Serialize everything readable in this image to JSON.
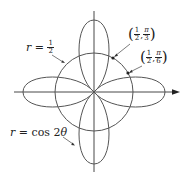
{
  "diagram": {
    "type": "polar-graph",
    "colors": {
      "curve": "#555555",
      "axis": "#333333",
      "point": "#222222",
      "text": "#222222",
      "background": "#ffffff"
    },
    "axes": {
      "horizontal": "polar axis with arrow",
      "vertical": "line"
    },
    "curves": [
      {
        "id": "circle",
        "equation": "r = 1/2"
      },
      {
        "id": "rose",
        "equation": "r = cos 2θ",
        "petals": 4
      }
    ],
    "labels": {
      "circle": {
        "lhs": "r",
        "eq": "=",
        "num": "1",
        "den": "2"
      },
      "rose": {
        "lhs": "r",
        "eq": "=",
        "rhs": "cos 2",
        "theta": "θ"
      },
      "point1": {
        "r_num": "1",
        "r_den": "2",
        "sep": ",",
        "t_num": "π",
        "t_den": "3"
      },
      "point2": {
        "r_num": "1",
        "r_den": "2",
        "sep": ",",
        "t_num": "π",
        "t_den": "6"
      }
    },
    "points": [
      {
        "r": "1/2",
        "theta": "π/3"
      },
      {
        "r": "1/2",
        "theta": "π/6"
      }
    ]
  }
}
